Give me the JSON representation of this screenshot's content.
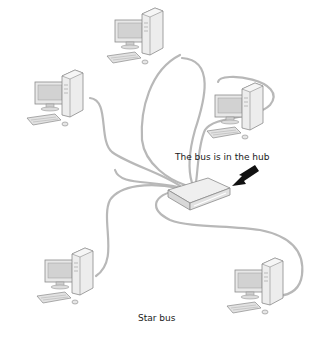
{
  "diagram": {
    "title": "Star bus",
    "annotation": "The bus is in the hub",
    "nodes": [
      {
        "id": "pc-top",
        "type": "computer",
        "position": "top"
      },
      {
        "id": "pc-left",
        "type": "computer",
        "position": "upper-left"
      },
      {
        "id": "pc-right",
        "type": "computer",
        "position": "upper-right"
      },
      {
        "id": "pc-bottom-left",
        "type": "computer",
        "position": "bottom-left"
      },
      {
        "id": "pc-bottom-right",
        "type": "computer",
        "position": "bottom-right"
      },
      {
        "id": "hub",
        "type": "hub",
        "position": "center"
      }
    ],
    "edges": [
      {
        "from": "pc-top",
        "to": "hub"
      },
      {
        "from": "pc-left",
        "to": "hub"
      },
      {
        "from": "pc-right",
        "to": "hub"
      },
      {
        "from": "pc-bottom-left",
        "to": "hub"
      },
      {
        "from": "pc-bottom-right",
        "to": "hub"
      }
    ],
    "arrow": {
      "points_to": "hub",
      "icon": "arrow-icon"
    },
    "colors": {
      "cable": "#b8b8b8",
      "device": "#e4e4e4",
      "outline": "#8a8a8a",
      "arrow": "#111111"
    }
  }
}
